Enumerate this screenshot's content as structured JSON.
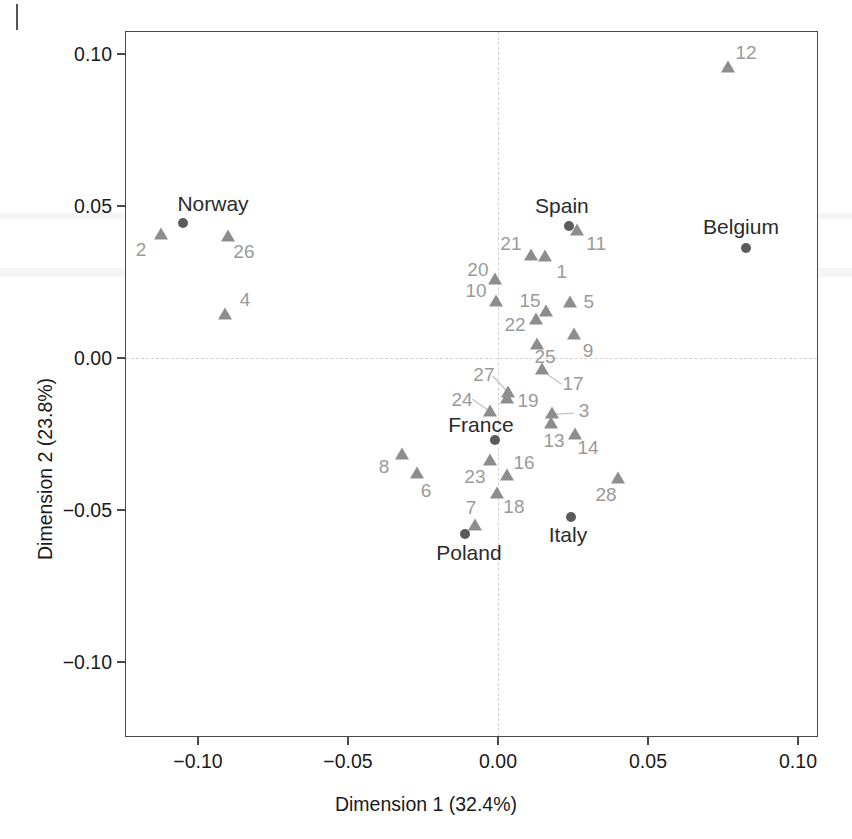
{
  "figure": {
    "axis_x_title": "Dimension 1 (32.4%)",
    "axis_y_title": "Dimension 2 (23.8%)"
  },
  "chart_data": {
    "type": "scatter",
    "title": "",
    "xlabel": "Dimension 1 (32.4%)",
    "ylabel": "Dimension 2 (23.8%)",
    "xlim": [
      -0.124,
      0.107
    ],
    "ylim": [
      -0.126,
      0.109
    ],
    "xticks": [
      -0.1,
      -0.05,
      0.0,
      0.05,
      0.1
    ],
    "xticklabels": [
      "−0.10",
      "−0.05",
      "0.00",
      "0.05",
      "0.10"
    ],
    "yticks": [
      -0.1,
      -0.05,
      0.0,
      0.05,
      0.1
    ],
    "yticklabels": [
      "−0.10",
      "−0.05",
      "0.00",
      "0.05",
      "0.10"
    ],
    "grid": false,
    "reference_lines": {
      "vertical_x": 0.0,
      "horizontal_y": 0.0,
      "style": "dashed",
      "color": "#d2d2d2"
    },
    "legend": "none",
    "series": [
      {
        "name": "variables",
        "marker": "triangle",
        "color": "#8d8d8d",
        "label_color": "#9a9a9a",
        "points": [
          {
            "label": "1",
            "x": 0.0157,
            "y": 0.0332,
            "lx": 0.0213,
            "ly": 0.0283
          },
          {
            "label": "2",
            "x": -0.1123,
            "y": 0.0403,
            "lx": -0.119,
            "ly": 0.0355
          },
          {
            "label": "3",
            "x": 0.018,
            "y": -0.0185,
            "lx": 0.0287,
            "ly": -0.0175
          },
          {
            "label": "4",
            "x": -0.091,
            "y": 0.0143,
            "lx": -0.0843,
            "ly": 0.0191
          },
          {
            "label": "5",
            "x": 0.024,
            "y": 0.0182,
            "lx": 0.0303,
            "ly": 0.0184
          },
          {
            "label": "6",
            "x": -0.027,
            "y": -0.0383,
            "lx": -0.024,
            "ly": -0.0438
          },
          {
            "label": "7",
            "x": -0.0077,
            "y": -0.0552,
            "lx": -0.009,
            "ly": -0.0493
          },
          {
            "label": "8",
            "x": -0.032,
            "y": -0.032,
            "lx": -0.038,
            "ly": -0.0358
          },
          {
            "label": "9",
            "x": 0.0253,
            "y": 0.0075,
            "lx": 0.03,
            "ly": 0.0023
          },
          {
            "label": "10",
            "x": -0.0007,
            "y": 0.0183,
            "lx": -0.0073,
            "ly": 0.0222
          },
          {
            "label": "11",
            "x": 0.0263,
            "y": 0.0417,
            "lx": 0.0327,
            "ly": 0.0375
          },
          {
            "label": "12",
            "x": 0.0767,
            "y": 0.0955,
            "lx": 0.0827,
            "ly": 0.1002
          },
          {
            "label": "13",
            "x": 0.0177,
            "y": -0.0216,
            "lx": 0.0187,
            "ly": -0.0273
          },
          {
            "label": "14",
            "x": 0.0257,
            "y": -0.0253,
            "lx": 0.03,
            "ly": -0.0297
          },
          {
            "label": "15",
            "x": 0.016,
            "y": 0.0152,
            "lx": 0.0107,
            "ly": 0.0188
          },
          {
            "label": "16",
            "x": 0.003,
            "y": -0.0388,
            "lx": 0.0087,
            "ly": -0.0345
          },
          {
            "label": "17",
            "x": 0.0147,
            "y": -0.004,
            "lx": 0.025,
            "ly": -0.0087
          },
          {
            "label": "18",
            "x": -0.0003,
            "y": -0.0448,
            "lx": 0.0053,
            "ly": -0.049
          },
          {
            "label": "19",
            "x": 0.003,
            "y": -0.0134,
            "lx": 0.01,
            "ly": -0.014
          },
          {
            "label": "20",
            "x": -0.001,
            "y": 0.0255,
            "lx": -0.0067,
            "ly": 0.0291
          },
          {
            "label": "21",
            "x": 0.011,
            "y": 0.0336,
            "lx": 0.0043,
            "ly": 0.0375
          },
          {
            "label": "22",
            "x": 0.0127,
            "y": 0.0126,
            "lx": 0.0057,
            "ly": 0.011
          },
          {
            "label": "23",
            "x": -0.0027,
            "y": -0.034,
            "lx": -0.0077,
            "ly": -0.0393
          },
          {
            "label": "24",
            "x": -0.0027,
            "y": -0.0177,
            "lx": -0.012,
            "ly": -0.0139
          },
          {
            "label": "25",
            "x": 0.013,
            "y": 0.0043,
            "lx": 0.0157,
            "ly": 0.0004
          },
          {
            "label": "26",
            "x": -0.09,
            "y": 0.0397,
            "lx": -0.0847,
            "ly": 0.035
          },
          {
            "label": "27",
            "x": 0.0033,
            "y": -0.0114,
            "lx": -0.0047,
            "ly": -0.0055
          },
          {
            "label": "28",
            "x": 0.04,
            "y": -0.0398,
            "lx": 0.036,
            "ly": -0.0451
          }
        ]
      },
      {
        "name": "countries",
        "marker": "circle",
        "color": "#5b5b5b",
        "label_color": "#2b2b2b",
        "points": [
          {
            "label": "Norway",
            "x": -0.105,
            "y": 0.0443,
            "lx": -0.095,
            "ly": 0.0508
          },
          {
            "label": "Belgium",
            "x": 0.0827,
            "y": 0.0362,
            "lx": 0.081,
            "ly": 0.043
          },
          {
            "label": "Spain",
            "x": 0.0237,
            "y": 0.0434,
            "lx": 0.0213,
            "ly": 0.05
          },
          {
            "label": "France",
            "x": -0.001,
            "y": -0.027,
            "lx": -0.0057,
            "ly": -0.0222
          },
          {
            "label": "Poland",
            "x": -0.011,
            "y": -0.0578,
            "lx": -0.0097,
            "ly": -0.064
          },
          {
            "label": "Italy",
            "x": 0.0243,
            "y": -0.0523,
            "lx": 0.0233,
            "ly": -0.0583
          }
        ]
      }
    ],
    "leaders": [
      {
        "from_label": "17",
        "x1": 0.0147,
        "y1": -0.004,
        "x2": 0.0213,
        "y2": -0.0085
      },
      {
        "from_label": "27",
        "x1": 0.0033,
        "y1": -0.0114,
        "x2": -0.002,
        "y2": -0.0058
      },
      {
        "from_label": "24",
        "x1": -0.0027,
        "y1": -0.0177,
        "x2": -0.0087,
        "y2": -0.0136
      },
      {
        "from_label": "3",
        "x1": 0.018,
        "y1": -0.0185,
        "x2": 0.0253,
        "y2": -0.018
      }
    ]
  }
}
